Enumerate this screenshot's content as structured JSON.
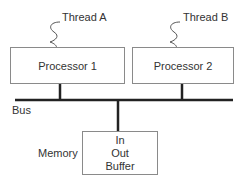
{
  "diagram": {
    "threads": [
      {
        "label": "Thread A"
      },
      {
        "label": "Thread B"
      }
    ],
    "processors": [
      {
        "label": "Processor 1"
      },
      {
        "label": "Processor 2"
      }
    ],
    "bus": {
      "label": "Bus"
    },
    "memory": {
      "label": "Memory",
      "contents": [
        "In",
        "Out",
        "Buffer"
      ]
    }
  }
}
